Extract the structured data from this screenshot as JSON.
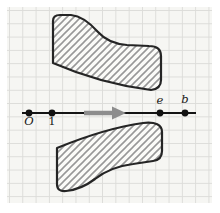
{
  "figure": {
    "kind": "number-line-diagram-on-graph-paper",
    "axis_points": [
      {
        "label": "O",
        "position": "below-line"
      },
      {
        "label": "1",
        "position": "below-line"
      },
      {
        "label": "e",
        "position": "above-line"
      },
      {
        "label": "b",
        "position": "above-line"
      }
    ],
    "regions": [
      {
        "name": "upper-hatched-region",
        "style": "diagonal-hatch"
      },
      {
        "name": "lower-hatched-region",
        "style": "diagonal-hatch"
      }
    ],
    "arrow": {
      "name": "direction-arrow",
      "direction": "right"
    },
    "colors": {
      "margin": "#ffffff",
      "paper": "#f6f6f3",
      "grid_line": "#dcdcd9",
      "shape_outline": "#252525",
      "shape_fill": "#fbfbf8",
      "hatch_line": "#989898",
      "axis_line": "#141414",
      "dot": "#111111",
      "arrow": "#8d8d8d",
      "label_text": "#161616"
    }
  }
}
